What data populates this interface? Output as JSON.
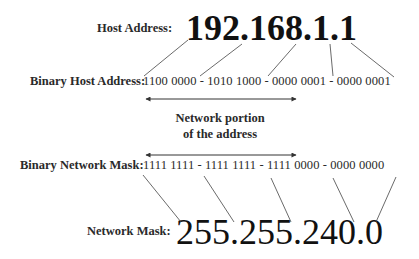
{
  "host": {
    "label": "Host Address:",
    "value": "192.168.1.1"
  },
  "binary_host": {
    "label": "Binary Host Address:",
    "value": "1100 0000 - 1010 1000 - 0000 0001 - 0000 0001"
  },
  "network_portion": {
    "line1": "Network portion",
    "line2": "of the address"
  },
  "binary_mask": {
    "label": "Binary Network Mask:",
    "value": "1111 1111 - 1111 1111 - 1111 0000 - 0000 0000"
  },
  "mask": {
    "label": "Network Mask:",
    "value": "255.255.240.0"
  }
}
